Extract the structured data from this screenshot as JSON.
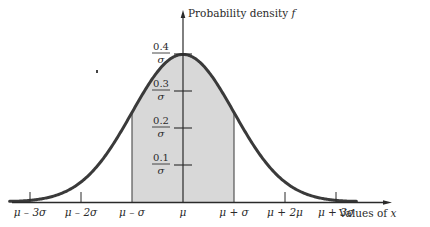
{
  "chart_data": {
    "type": "area",
    "title": "",
    "xlabel": "Values of x",
    "ylabel": "Probability density f",
    "x_ticks": [
      "μ − 3σ",
      "μ − 2σ",
      "μ − σ",
      "μ",
      "μ + σ",
      "μ + 2μ",
      "μ + 3σ"
    ],
    "x_tick_z": [
      -3,
      -2,
      -1,
      0,
      1,
      2,
      3
    ],
    "y_ticks": [
      {
        "num": "0.1",
        "den": "σ",
        "value": 0.1
      },
      {
        "num": "0.2",
        "den": "σ",
        "value": 0.2
      },
      {
        "num": "0.3",
        "den": "σ",
        "value": 0.3
      },
      {
        "num": "0.4",
        "den": "σ",
        "value": 0.4
      }
    ],
    "series": [
      {
        "name": "Normal density f(x)",
        "x_z": [
          -3.4,
          -3,
          -2.5,
          -2,
          -1.5,
          -1,
          -0.5,
          0,
          0.5,
          1,
          1.5,
          2,
          2.5,
          3,
          3.4
        ],
        "values": [
          0.0012,
          0.0044,
          0.0175,
          0.054,
          0.1295,
          0.242,
          0.3521,
          0.3989,
          0.3521,
          0.242,
          0.1295,
          0.054,
          0.0175,
          0.0044,
          0.0012
        ]
      }
    ],
    "shaded_region": {
      "from_z": -1,
      "to_z": 1,
      "color": "#d8d8d8"
    },
    "xlim_z": [
      -3.4,
      4.1
    ],
    "ylim": [
      0,
      0.52
    ],
    "grid": false,
    "legend": "none"
  },
  "colors": {
    "curve": "#3a3a3a",
    "axis": "#2a2a2a",
    "shade": "#d8d8d8",
    "background": "#ffffff"
  }
}
